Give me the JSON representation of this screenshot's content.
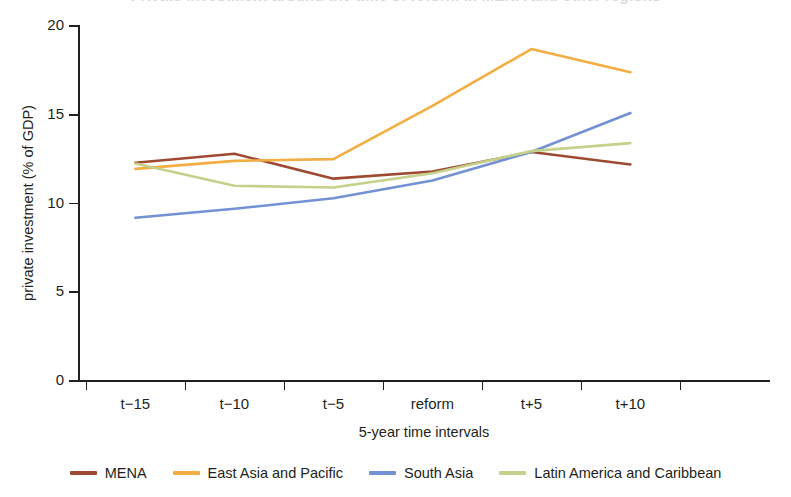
{
  "chart_data": {
    "type": "line",
    "title": "Private investment around the time of reform in MENA and other regions",
    "xlabel": "5-year time intervals",
    "ylabel": "private investment (% of GDP)",
    "categories": [
      "t−15",
      "t−10",
      "t−5",
      "reform",
      "t+5",
      "t+10"
    ],
    "xticks": [
      "t−15",
      "t−10",
      "t−5",
      "reform",
      "t+5",
      "t+10"
    ],
    "yticks": [
      "0",
      "5",
      "10",
      "15",
      "20"
    ],
    "ytick_values": [
      0,
      5,
      10,
      15,
      20
    ],
    "ylim": [
      0,
      20
    ],
    "grid": false,
    "legend_position": "bottom",
    "series": [
      {
        "name": "MENA",
        "color": "#9e4a32",
        "values": [
          12.3,
          12.8,
          11.4,
          11.8,
          12.9,
          12.2
        ]
      },
      {
        "name": "East Asia and Pacific",
        "color": "#f2ad43",
        "values": [
          11.95,
          12.4,
          12.5,
          15.5,
          18.7,
          17.4
        ]
      },
      {
        "name": "South Asia",
        "color": "#7391d4",
        "values": [
          9.2,
          9.7,
          10.3,
          11.3,
          12.9,
          15.1
        ]
      },
      {
        "name": "Latin America and Caribbean",
        "color": "#c4d18b",
        "values": [
          12.25,
          11.0,
          10.9,
          11.7,
          12.95,
          13.4
        ]
      }
    ]
  },
  "legend": {
    "items": [
      {
        "label": "MENA",
        "color": "#9e4a32"
      },
      {
        "label": "East Asia and Pacific",
        "color": "#f2ad43"
      },
      {
        "label": "South Asia",
        "color": "#7391d4"
      },
      {
        "label": "Latin America and Caribbean",
        "color": "#c4d18b"
      }
    ]
  },
  "axes": {
    "y_title": "private investment (% of GDP)",
    "x_title": "5-year time intervals"
  }
}
